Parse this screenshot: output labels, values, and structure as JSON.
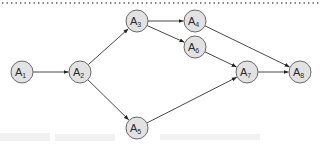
{
  "diagram": {
    "type": "directed-graph",
    "colors": {
      "node_fill": "#e2e2e2",
      "node_stroke": "#6a6a6a",
      "edge": "#333333",
      "label": "#2a2a2a",
      "top_rule": "#555555"
    },
    "node_radius": 11,
    "nodes": [
      {
        "id": "A1",
        "base": "A",
        "sub": "1",
        "x": 22,
        "y": 72
      },
      {
        "id": "A2",
        "base": "A",
        "sub": "2",
        "x": 80,
        "y": 72
      },
      {
        "id": "A3",
        "base": "A",
        "sub": "3",
        "x": 137,
        "y": 21
      },
      {
        "id": "A4",
        "base": "A",
        "sub": "4",
        "x": 195,
        "y": 21
      },
      {
        "id": "A5",
        "base": "A",
        "sub": "5",
        "x": 137,
        "y": 128
      },
      {
        "id": "A6",
        "base": "A",
        "sub": "6",
        "x": 195,
        "y": 47
      },
      {
        "id": "A7",
        "base": "A",
        "sub": "7",
        "x": 247,
        "y": 72
      },
      {
        "id": "A8",
        "base": "A",
        "sub": "8",
        "x": 300,
        "y": 72
      }
    ],
    "edges": [
      {
        "from": "A1",
        "to": "A2"
      },
      {
        "from": "A2",
        "to": "A3"
      },
      {
        "from": "A2",
        "to": "A5"
      },
      {
        "from": "A3",
        "to": "A4"
      },
      {
        "from": "A3",
        "to": "A6"
      },
      {
        "from": "A4",
        "to": "A8"
      },
      {
        "from": "A6",
        "to": "A7"
      },
      {
        "from": "A5",
        "to": "A7"
      },
      {
        "from": "A7",
        "to": "A8"
      }
    ]
  }
}
